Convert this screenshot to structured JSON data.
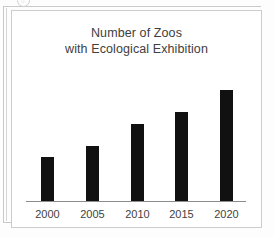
{
  "document": {
    "top_marker_icon": "circle-marker-icon",
    "top_marker_glyph": "○"
  },
  "chart_data": {
    "type": "bar",
    "title": "Number of Zoos\nwith Ecological Exhibition",
    "title_line1": "Number of Zoos",
    "title_line2": "with Ecological Exhibition",
    "xlabel": "",
    "ylabel": "",
    "categories": [
      "2000",
      "2005",
      "2010",
      "2015",
      "2020"
    ],
    "values": [
      20,
      25,
      35,
      40,
      50
    ],
    "ylim": [
      0,
      55
    ],
    "grid": false,
    "legend": false,
    "bar_color": "#111111",
    "axis_color": "#8c8c8c",
    "text_color": "#404040",
    "bars": [
      {
        "category": "2000",
        "value": 20,
        "pixel_height": 44,
        "left": 15
      },
      {
        "category": "2005",
        "value": 25,
        "pixel_height": 55,
        "left": 60
      },
      {
        "category": "2010",
        "value": 35,
        "pixel_height": 77,
        "left": 105
      },
      {
        "category": "2015",
        "value": 40,
        "pixel_height": 89,
        "left": 149
      },
      {
        "category": "2020",
        "value": 50,
        "pixel_height": 111,
        "left": 194
      }
    ]
  }
}
